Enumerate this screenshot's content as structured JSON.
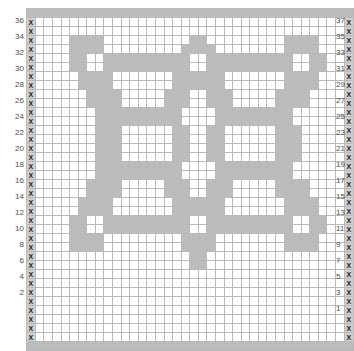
{
  "chart_data": {
    "type": "heatmap",
    "title": "",
    "xlabel": "",
    "ylabel": "",
    "grid": true,
    "legend": "none",
    "columns": 38,
    "rows": 38,
    "cell_symbol": "X",
    "colors": {
      "filled": "#bcbcbc",
      "empty": "#ffffff",
      "marker_cell": "#cfcfcf",
      "gridline": "#b9b9b9",
      "heavy_gridline": "#4a4a4a",
      "label_text": "#4d4d4d"
    },
    "heavy_line_interval": 10,
    "row_labels_left": [
      36,
      34,
      32,
      30,
      28,
      26,
      24,
      22,
      20,
      18,
      16,
      14,
      12,
      10,
      8,
      6,
      4,
      2
    ],
    "row_labels_right": [
      37,
      35,
      33,
      31,
      29,
      27,
      25,
      23,
      21,
      19,
      17,
      15,
      13,
      11,
      9,
      7,
      5,
      3,
      1
    ],
    "matrix": [
      [
        1,
        1,
        1,
        1,
        1,
        1,
        1,
        1,
        1,
        1,
        1,
        1,
        1,
        1,
        1,
        1,
        1,
        1,
        1,
        1,
        1,
        1,
        1,
        1,
        1,
        1,
        1,
        1,
        1,
        1,
        1,
        1,
        1,
        1,
        1,
        1,
        1,
        1
      ],
      [
        2,
        0,
        0,
        0,
        0,
        0,
        0,
        0,
        0,
        0,
        0,
        0,
        0,
        0,
        0,
        0,
        0,
        0,
        0,
        0,
        0,
        0,
        0,
        0,
        0,
        0,
        0,
        0,
        0,
        0,
        0,
        0,
        0,
        0,
        0,
        0,
        0,
        2
      ],
      [
        2,
        0,
        0,
        0,
        0,
        0,
        0,
        0,
        0,
        0,
        0,
        0,
        0,
        0,
        0,
        0,
        0,
        0,
        0,
        0,
        0,
        0,
        0,
        0,
        0,
        0,
        0,
        0,
        0,
        0,
        0,
        0,
        0,
        0,
        0,
        0,
        0,
        2
      ],
      [
        2,
        0,
        0,
        0,
        0,
        1,
        1,
        1,
        1,
        0,
        0,
        0,
        0,
        0,
        0,
        0,
        0,
        0,
        0,
        1,
        1,
        0,
        0,
        0,
        0,
        0,
        0,
        0,
        0,
        0,
        1,
        1,
        1,
        1,
        0,
        0,
        0,
        2
      ],
      [
        2,
        0,
        0,
        0,
        0,
        1,
        1,
        1,
        1,
        0,
        0,
        0,
        0,
        0,
        0,
        0,
        0,
        0,
        1,
        1,
        1,
        1,
        0,
        0,
        0,
        0,
        0,
        0,
        0,
        0,
        1,
        1,
        1,
        1,
        0,
        0,
        0,
        2
      ],
      [
        2,
        0,
        0,
        0,
        0,
        1,
        1,
        0,
        0,
        1,
        1,
        1,
        1,
        1,
        1,
        1,
        1,
        1,
        1,
        0,
        0,
        1,
        1,
        1,
        1,
        1,
        1,
        1,
        1,
        1,
        1,
        0,
        0,
        1,
        1,
        0,
        0,
        2
      ],
      [
        2,
        0,
        0,
        0,
        0,
        1,
        1,
        0,
        0,
        1,
        1,
        1,
        1,
        1,
        1,
        1,
        1,
        1,
        1,
        0,
        0,
        1,
        1,
        1,
        1,
        1,
        1,
        1,
        1,
        1,
        1,
        0,
        0,
        1,
        1,
        0,
        0,
        2
      ],
      [
        2,
        0,
        0,
        0,
        0,
        0,
        1,
        1,
        1,
        1,
        0,
        0,
        0,
        0,
        0,
        0,
        0,
        1,
        1,
        1,
        1,
        1,
        1,
        0,
        0,
        0,
        0,
        0,
        0,
        0,
        1,
        1,
        1,
        1,
        0,
        0,
        0,
        2
      ],
      [
        2,
        0,
        0,
        0,
        0,
        0,
        1,
        1,
        1,
        1,
        0,
        0,
        0,
        0,
        0,
        0,
        0,
        1,
        1,
        1,
        1,
        1,
        1,
        0,
        0,
        0,
        0,
        0,
        0,
        0,
        1,
        1,
        1,
        1,
        0,
        0,
        0,
        2
      ],
      [
        2,
        0,
        0,
        0,
        0,
        0,
        0,
        1,
        1,
        1,
        1,
        0,
        0,
        0,
        0,
        0,
        1,
        1,
        1,
        0,
        0,
        1,
        1,
        1,
        0,
        0,
        0,
        0,
        0,
        1,
        1,
        1,
        1,
        0,
        0,
        0,
        0,
        2
      ],
      [
        2,
        0,
        0,
        0,
        0,
        0,
        0,
        1,
        1,
        1,
        1,
        0,
        0,
        0,
        0,
        0,
        1,
        1,
        1,
        0,
        0,
        1,
        1,
        1,
        0,
        0,
        0,
        0,
        0,
        1,
        1,
        1,
        1,
        0,
        0,
        0,
        0,
        2
      ],
      [
        2,
        0,
        0,
        0,
        0,
        0,
        0,
        0,
        1,
        1,
        1,
        1,
        1,
        1,
        1,
        1,
        1,
        1,
        0,
        0,
        0,
        0,
        1,
        1,
        1,
        1,
        1,
        1,
        1,
        1,
        1,
        0,
        0,
        0,
        0,
        0,
        0,
        2
      ],
      [
        2,
        0,
        0,
        0,
        0,
        0,
        0,
        0,
        1,
        1,
        1,
        1,
        1,
        1,
        1,
        1,
        1,
        1,
        0,
        0,
        0,
        0,
        1,
        1,
        1,
        1,
        1,
        1,
        1,
        1,
        1,
        0,
        0,
        0,
        0,
        0,
        0,
        2
      ],
      [
        2,
        0,
        0,
        0,
        0,
        0,
        0,
        0,
        1,
        1,
        1,
        0,
        0,
        0,
        0,
        0,
        0,
        1,
        1,
        0,
        0,
        1,
        1,
        0,
        0,
        0,
        0,
        0,
        0,
        1,
        1,
        1,
        0,
        0,
        0,
        0,
        0,
        2
      ],
      [
        2,
        0,
        0,
        0,
        0,
        0,
        0,
        0,
        1,
        1,
        1,
        0,
        0,
        0,
        0,
        0,
        0,
        1,
        1,
        0,
        0,
        1,
        1,
        0,
        0,
        0,
        0,
        0,
        0,
        1,
        1,
        1,
        0,
        0,
        0,
        0,
        0,
        2
      ],
      [
        2,
        0,
        0,
        0,
        0,
        0,
        0,
        0,
        1,
        1,
        1,
        0,
        0,
        0,
        0,
        0,
        0,
        1,
        1,
        0,
        0,
        1,
        1,
        0,
        0,
        0,
        0,
        0,
        0,
        1,
        1,
        1,
        0,
        0,
        0,
        0,
        0,
        2
      ],
      [
        2,
        0,
        0,
        0,
        0,
        0,
        0,
        0,
        1,
        1,
        1,
        0,
        0,
        0,
        0,
        0,
        0,
        1,
        1,
        0,
        0,
        1,
        1,
        0,
        0,
        0,
        0,
        0,
        0,
        1,
        1,
        1,
        0,
        0,
        0,
        0,
        0,
        2
      ],
      [
        2,
        0,
        0,
        0,
        0,
        0,
        0,
        0,
        1,
        1,
        1,
        1,
        1,
        1,
        1,
        1,
        1,
        1,
        0,
        0,
        0,
        0,
        1,
        1,
        1,
        1,
        1,
        1,
        1,
        1,
        1,
        0,
        0,
        0,
        0,
        0,
        0,
        2
      ],
      [
        2,
        0,
        0,
        0,
        0,
        0,
        0,
        0,
        1,
        1,
        1,
        1,
        1,
        1,
        1,
        1,
        1,
        1,
        0,
        0,
        0,
        0,
        1,
        1,
        1,
        1,
        1,
        1,
        1,
        1,
        1,
        0,
        0,
        0,
        0,
        0,
        0,
        2
      ],
      [
        2,
        0,
        0,
        0,
        0,
        0,
        0,
        1,
        1,
        1,
        1,
        0,
        0,
        0,
        0,
        0,
        1,
        1,
        1,
        0,
        0,
        1,
        1,
        1,
        0,
        0,
        0,
        0,
        0,
        1,
        1,
        1,
        1,
        0,
        0,
        0,
        0,
        2
      ],
      [
        2,
        0,
        0,
        0,
        0,
        0,
        0,
        1,
        1,
        1,
        1,
        0,
        0,
        0,
        0,
        0,
        1,
        1,
        1,
        0,
        0,
        1,
        1,
        1,
        0,
        0,
        0,
        0,
        0,
        1,
        1,
        1,
        1,
        0,
        0,
        0,
        0,
        2
      ],
      [
        2,
        0,
        0,
        0,
        0,
        0,
        1,
        1,
        1,
        1,
        0,
        0,
        0,
        0,
        0,
        0,
        0,
        1,
        1,
        1,
        1,
        1,
        1,
        0,
        0,
        0,
        0,
        0,
        0,
        0,
        1,
        1,
        1,
        1,
        0,
        0,
        0,
        2
      ],
      [
        2,
        0,
        0,
        0,
        0,
        0,
        1,
        1,
        1,
        1,
        0,
        0,
        0,
        0,
        0,
        0,
        0,
        1,
        1,
        1,
        1,
        1,
        1,
        0,
        0,
        0,
        0,
        0,
        0,
        0,
        1,
        1,
        1,
        1,
        0,
        0,
        0,
        2
      ],
      [
        2,
        0,
        0,
        0,
        0,
        1,
        1,
        0,
        0,
        1,
        1,
        1,
        1,
        1,
        1,
        1,
        1,
        1,
        1,
        0,
        0,
        1,
        1,
        1,
        1,
        1,
        1,
        1,
        1,
        1,
        1,
        0,
        0,
        1,
        1,
        0,
        0,
        2
      ],
      [
        2,
        0,
        0,
        0,
        0,
        1,
        1,
        0,
        0,
        1,
        1,
        1,
        1,
        1,
        1,
        1,
        1,
        1,
        1,
        0,
        0,
        1,
        1,
        1,
        1,
        1,
        1,
        1,
        1,
        1,
        1,
        0,
        0,
        1,
        1,
        0,
        0,
        2
      ],
      [
        2,
        0,
        0,
        0,
        0,
        1,
        1,
        1,
        1,
        0,
        0,
        0,
        0,
        0,
        0,
        0,
        0,
        0,
        1,
        1,
        1,
        1,
        0,
        0,
        0,
        0,
        0,
        0,
        0,
        0,
        1,
        1,
        1,
        1,
        0,
        0,
        0,
        2
      ],
      [
        2,
        0,
        0,
        0,
        0,
        1,
        1,
        1,
        1,
        0,
        0,
        0,
        0,
        0,
        0,
        0,
        0,
        0,
        1,
        1,
        1,
        1,
        0,
        0,
        0,
        0,
        0,
        0,
        0,
        0,
        1,
        1,
        1,
        1,
        0,
        0,
        0,
        2
      ],
      [
        2,
        0,
        0,
        0,
        0,
        0,
        0,
        0,
        0,
        0,
        0,
        0,
        0,
        0,
        0,
        0,
        0,
        0,
        0,
        1,
        1,
        0,
        0,
        0,
        0,
        0,
        0,
        0,
        0,
        0,
        0,
        0,
        0,
        0,
        0,
        0,
        0,
        2
      ],
      [
        2,
        0,
        0,
        0,
        0,
        0,
        0,
        0,
        0,
        0,
        0,
        0,
        0,
        0,
        0,
        0,
        0,
        0,
        0,
        1,
        1,
        0,
        0,
        0,
        0,
        0,
        0,
        0,
        0,
        0,
        0,
        0,
        0,
        0,
        0,
        0,
        0,
        2
      ],
      [
        2,
        0,
        0,
        0,
        0,
        0,
        0,
        0,
        0,
        0,
        0,
        0,
        0,
        0,
        0,
        0,
        0,
        0,
        0,
        0,
        0,
        0,
        0,
        0,
        0,
        0,
        0,
        0,
        0,
        0,
        0,
        0,
        0,
        0,
        0,
        0,
        0,
        2
      ],
      [
        2,
        0,
        0,
        0,
        0,
        0,
        0,
        0,
        0,
        0,
        0,
        0,
        0,
        0,
        0,
        0,
        0,
        0,
        0,
        0,
        0,
        0,
        0,
        0,
        0,
        0,
        0,
        0,
        0,
        0,
        0,
        0,
        0,
        0,
        0,
        0,
        0,
        2
      ],
      [
        2,
        0,
        0,
        0,
        0,
        0,
        0,
        0,
        0,
        0,
        0,
        0,
        0,
        0,
        0,
        0,
        0,
        0,
        0,
        0,
        0,
        0,
        0,
        0,
        0,
        0,
        0,
        0,
        0,
        0,
        0,
        0,
        0,
        0,
        0,
        0,
        0,
        2
      ],
      [
        2,
        0,
        0,
        0,
        0,
        0,
        0,
        0,
        0,
        0,
        0,
        0,
        0,
        0,
        0,
        0,
        0,
        0,
        0,
        0,
        0,
        0,
        0,
        0,
        0,
        0,
        0,
        0,
        0,
        0,
        0,
        0,
        0,
        0,
        0,
        0,
        0,
        2
      ],
      [
        2,
        0,
        0,
        0,
        0,
        0,
        0,
        0,
        0,
        0,
        0,
        0,
        0,
        0,
        0,
        0,
        0,
        0,
        0,
        0,
        0,
        0,
        0,
        0,
        0,
        0,
        0,
        0,
        0,
        0,
        0,
        0,
        0,
        0,
        0,
        0,
        0,
        2
      ],
      [
        2,
        0,
        0,
        0,
        0,
        0,
        0,
        0,
        0,
        0,
        0,
        0,
        0,
        0,
        0,
        0,
        0,
        0,
        0,
        0,
        0,
        0,
        0,
        0,
        0,
        0,
        0,
        0,
        0,
        0,
        0,
        0,
        0,
        0,
        0,
        0,
        0,
        2
      ],
      [
        2,
        0,
        0,
        0,
        0,
        0,
        0,
        0,
        0,
        0,
        0,
        0,
        0,
        0,
        0,
        0,
        0,
        0,
        0,
        0,
        0,
        0,
        0,
        0,
        0,
        0,
        0,
        0,
        0,
        0,
        0,
        0,
        0,
        0,
        0,
        0,
        0,
        2
      ],
      [
        2,
        0,
        0,
        0,
        0,
        0,
        0,
        0,
        0,
        0,
        0,
        0,
        0,
        0,
        0,
        0,
        0,
        0,
        0,
        0,
        0,
        0,
        0,
        0,
        0,
        0,
        0,
        0,
        0,
        0,
        0,
        0,
        0,
        0,
        0,
        0,
        0,
        2
      ],
      [
        1,
        1,
        1,
        1,
        1,
        1,
        1,
        1,
        1,
        1,
        1,
        1,
        1,
        1,
        1,
        1,
        1,
        1,
        1,
        1,
        1,
        1,
        1,
        1,
        1,
        1,
        1,
        1,
        1,
        1,
        1,
        1,
        1,
        1,
        1,
        1,
        1,
        1
      ]
    ]
  }
}
